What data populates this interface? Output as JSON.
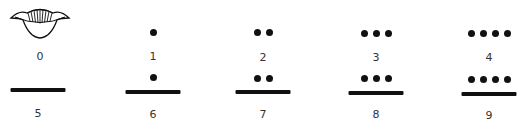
{
  "numerals": [
    {
      "value": 0,
      "label": "0",
      "dots": 0,
      "bars": 0,
      "glyph": "shell-icon"
    },
    {
      "value": 1,
      "label": "1",
      "dots": 1,
      "bars": 0
    },
    {
      "value": 2,
      "label": "2",
      "dots": 2,
      "bars": 0
    },
    {
      "value": 3,
      "label": "3",
      "dots": 3,
      "bars": 0
    },
    {
      "value": 4,
      "label": "4",
      "dots": 4,
      "bars": 0
    },
    {
      "value": 5,
      "label": "5",
      "dots": 0,
      "bars": 1
    },
    {
      "value": 6,
      "label": "6",
      "dots": 1,
      "bars": 1
    },
    {
      "value": 7,
      "label": "7",
      "dots": 2,
      "bars": 1
    },
    {
      "value": 8,
      "label": "8",
      "dots": 3,
      "bars": 1
    },
    {
      "value": 9,
      "label": "9",
      "dots": 4,
      "bars": 1
    }
  ],
  "colors": {
    "ink": "#111111",
    "background": "#ffffff"
  }
}
